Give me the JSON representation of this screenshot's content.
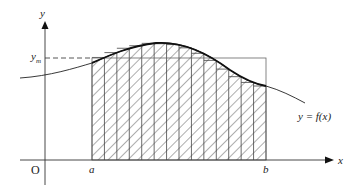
{
  "diagram": {
    "type": "integral-mean-value-riemann-strips",
    "labels": {
      "y_axis": "y",
      "x_axis": "x",
      "origin": "O",
      "a": "a",
      "b": "b",
      "y_m": "y",
      "y_m_sub": "m",
      "curve": "y = f(x)"
    },
    "strip_count": 14,
    "colors": {
      "stroke": "#222222",
      "hatch": "#333333",
      "background": "#ffffff"
    }
  }
}
